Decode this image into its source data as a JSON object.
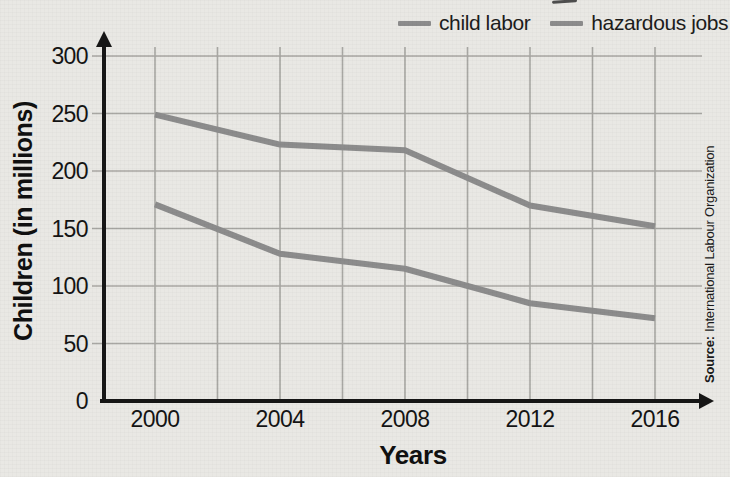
{
  "chart_data": {
    "type": "line",
    "x": [
      2000,
      2004,
      2008,
      2012,
      2016
    ],
    "series": [
      {
        "name": "child labor",
        "values": [
          249,
          223,
          218,
          170,
          152
        ],
        "color": "#8c8c8c"
      },
      {
        "name": "hazardous jobs",
        "values": [
          171,
          128,
          115,
          85,
          72
        ],
        "color": "#8c8c8c"
      }
    ],
    "xlabel": "Years",
    "ylabel": "Children (in millions)",
    "ylim": [
      0,
      300
    ],
    "xlim": [
      2000,
      2016
    ],
    "y_ticks": [
      0,
      50,
      100,
      150,
      200,
      250,
      300
    ],
    "x_gridline_step_years": 2,
    "grid": true,
    "legend_position": "top-right",
    "axis_color": "#161616",
    "gridline_color": "#a8a7a3",
    "background_color": "#e9e8e4"
  },
  "source": {
    "label": "Source:",
    "text": "International Labour Organization"
  }
}
